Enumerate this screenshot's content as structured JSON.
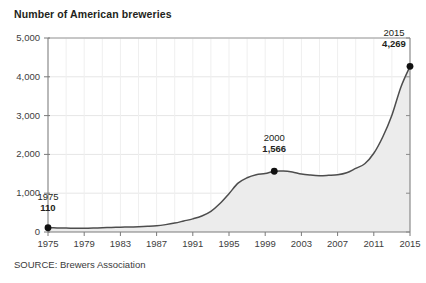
{
  "chart_data": {
    "type": "area",
    "title": "Number of American breweries",
    "source": "SOURCE: Brewers Association",
    "xlabel": "",
    "ylabel": "",
    "xlim": [
      1975,
      2015
    ],
    "ylim": [
      0,
      5000
    ],
    "grid": true,
    "legend": "none",
    "line_color": "#4d4d4d",
    "fill_color": "#ececec",
    "marker_color": "#111111",
    "axis_color": "#808080",
    "grid_color": "#e6e6e6",
    "ytick_labels": [
      "0",
      "1,000",
      "2,000",
      "3,000",
      "4,000",
      "5,000"
    ],
    "ytick_values": [
      0,
      1000,
      2000,
      3000,
      4000,
      5000
    ],
    "xtick_labels": [
      "1975",
      "1979",
      "1983",
      "1987",
      "1991",
      "1995",
      "1999",
      "2003",
      "2007",
      "2011",
      "2015"
    ],
    "xtick_values": [
      1975,
      1979,
      1983,
      1987,
      1991,
      1995,
      1999,
      2003,
      2007,
      2011,
      2015
    ],
    "x": [
      1975,
      1976,
      1977,
      1978,
      1979,
      1980,
      1981,
      1982,
      1983,
      1984,
      1985,
      1986,
      1987,
      1988,
      1989,
      1990,
      1991,
      1992,
      1993,
      1994,
      1995,
      1996,
      1997,
      1998,
      1999,
      2000,
      2001,
      2002,
      2003,
      2004,
      2005,
      2006,
      2007,
      2008,
      2009,
      2010,
      2011,
      2012,
      2013,
      2014,
      2015
    ],
    "values": [
      110,
      105,
      100,
      96,
      95,
      101,
      110,
      118,
      124,
      130,
      135,
      145,
      160,
      190,
      230,
      284,
      339,
      413,
      533,
      733,
      989,
      1259,
      1399,
      1477,
      1508,
      1566,
      1573,
      1545,
      1492,
      1466,
      1452,
      1460,
      1473,
      1525,
      1639,
      1759,
      2029,
      2456,
      3010,
      3739,
      4269
    ],
    "annotations": [
      {
        "year": 1975,
        "value": 110,
        "value_label": "110",
        "year_label": "1975"
      },
      {
        "year": 2000,
        "value": 1566,
        "value_label": "1,566",
        "year_label": "2000"
      },
      {
        "year": 2015,
        "value": 4269,
        "value_label": "4,269",
        "year_label": "2015"
      }
    ]
  }
}
